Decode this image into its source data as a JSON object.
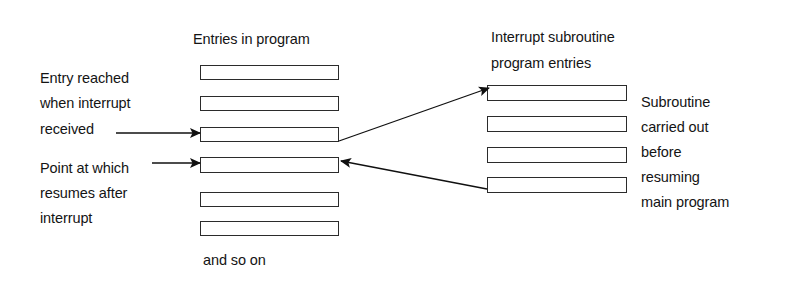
{
  "diagram": {
    "title_left": "Entries in program",
    "title_right_line1": "Interrupt subroutine",
    "title_right_line2": "program entries",
    "footer_note": "and so on",
    "stroke_color": "#2b2b2b",
    "background_color": "#ffffff",
    "text_color": "#141414"
  },
  "labels": {
    "entry_reached": {
      "line1": "Entry reached",
      "line2": "when interrupt",
      "line3": "received"
    },
    "point_at_which": {
      "line1": "Point at which",
      "line2": "resumes after",
      "line3": "interrupt"
    },
    "subroutine_note": {
      "line1": "Subroutine",
      "line2": "carried out",
      "line3": "before",
      "line4": "resuming",
      "line5": "main program"
    }
  },
  "main_program_entries": [
    {
      "index": 1,
      "name": "program-entry-1"
    },
    {
      "index": 2,
      "name": "program-entry-2"
    },
    {
      "index": 3,
      "name": "program-entry-3"
    },
    {
      "index": 4,
      "name": "program-entry-4"
    },
    {
      "index": 5,
      "name": "program-entry-5"
    },
    {
      "index": 6,
      "name": "program-entry-6"
    }
  ],
  "subroutine_entries": [
    {
      "index": 1,
      "name": "subroutine-entry-1"
    },
    {
      "index": 2,
      "name": "subroutine-entry-2"
    },
    {
      "index": 3,
      "name": "subroutine-entry-3"
    },
    {
      "index": 4,
      "name": "subroutine-entry-4"
    }
  ],
  "connectors": [
    {
      "name": "received-to-entry3",
      "kind": "horizontal-arrow",
      "direction": "right"
    },
    {
      "name": "point-to-entry4",
      "kind": "horizontal-arrow",
      "direction": "right"
    },
    {
      "name": "entry3-to-subroutine1",
      "kind": "diagonal-arrow",
      "direction": "up-right"
    },
    {
      "name": "subroutine4-to-entry4",
      "kind": "diagonal-arrow",
      "direction": "up-left"
    }
  ]
}
